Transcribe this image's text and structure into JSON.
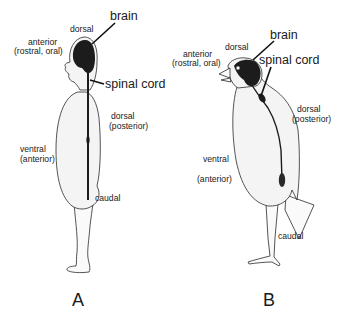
{
  "figure": {
    "panel_a": {
      "panel_label": "A",
      "labels": {
        "brain": "brain",
        "spinal_cord": "spinal cord",
        "dorsal_top": "dorsal",
        "anterior": "anterior",
        "anterior_sub": "(rostral, oral)",
        "dorsal_back": "dorsal",
        "dorsal_back_sub": "(posterior)",
        "ventral": "ventral",
        "ventral_sub": "(anterior)",
        "caudal": "caudal"
      }
    },
    "panel_b": {
      "panel_label": "B",
      "labels": {
        "brain": "brain",
        "spinal_cord": "spinal cord",
        "dorsal_top": "dorsal",
        "anterior": "anterior",
        "anterior_sub": "(rostral, oral)",
        "dorsal_back": "dorsal",
        "dorsal_back_sub": "(posterior)",
        "ventral": "ventral",
        "ventral_sub": "(anterior)",
        "caudal": "caudal"
      }
    },
    "colors": {
      "outline": "#2a2a2a",
      "body_fill": "#f4f4f4",
      "brain_cord": "#1c1c1c"
    }
  }
}
